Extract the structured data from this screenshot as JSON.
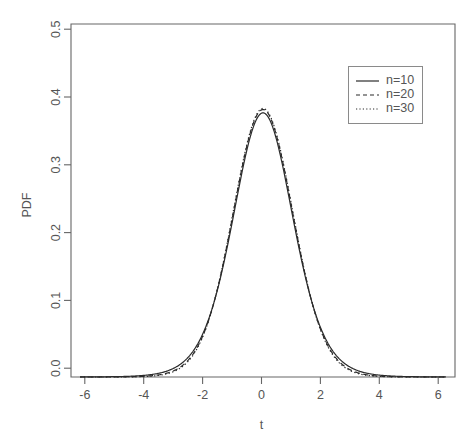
{
  "chart_data": {
    "type": "line",
    "title": "",
    "xlabel": "t",
    "ylabel": "PDF",
    "xlim": [
      -6.3,
      6.3
    ],
    "ylim": [
      0.0,
      0.52
    ],
    "grid": false,
    "legend_position": "top-right",
    "xticks": [
      "-6",
      "-4",
      "-2",
      "0",
      "2",
      "4",
      "6"
    ],
    "xtick_values": [
      -6,
      -4,
      -2,
      0,
      2,
      4,
      6
    ],
    "yticks": [
      "0.0",
      "0.1",
      "0.2",
      "0.3",
      "0.4",
      "0.5"
    ],
    "ytick_values": [
      0.0,
      0.1,
      0.2,
      0.3,
      0.4,
      0.5
    ],
    "x": [
      -6.0,
      -5.75,
      -5.5,
      -5.25,
      -5.0,
      -4.75,
      -4.5,
      -4.25,
      -4.0,
      -3.75,
      -3.5,
      -3.25,
      -3.0,
      -2.75,
      -2.5,
      -2.25,
      -2.0,
      -1.75,
      -1.5,
      -1.25,
      -1.0,
      -0.75,
      -0.5,
      -0.25,
      0.0,
      0.25,
      0.5,
      0.75,
      1.0,
      1.25,
      1.5,
      1.75,
      2.0,
      2.25,
      2.5,
      2.75,
      3.0,
      3.25,
      3.5,
      3.75,
      4.0,
      4.25,
      4.5,
      4.75,
      5.0,
      5.25,
      5.5,
      5.75,
      6.0
    ],
    "series": [
      {
        "name": "n=10",
        "style": "solid",
        "values": [
          0.0007,
          0.0009,
          0.0011,
          0.0014,
          0.0018,
          0.0023,
          0.003,
          0.0039,
          0.0051,
          0.0068,
          0.0091,
          0.0123,
          0.0168,
          0.0231,
          0.0322,
          0.045,
          0.0628,
          0.0868,
          0.1176,
          0.1548,
          0.1968,
          0.2402,
          0.2803,
          0.3123,
          0.3891,
          0.3123,
          0.2803,
          0.2402,
          0.1968,
          0.1548,
          0.1176,
          0.0868,
          0.0628,
          0.045,
          0.0322,
          0.0231,
          0.0168,
          0.0123,
          0.0091,
          0.0068,
          0.0051,
          0.0039,
          0.003,
          0.0023,
          0.0018,
          0.0014,
          0.0011,
          0.0009,
          0.0007
        ]
      },
      {
        "name": "n=20",
        "style": "dashed",
        "values": [
          0.0003,
          0.0004,
          0.0005,
          0.0007,
          0.0009,
          0.0012,
          0.0017,
          0.0023,
          0.0032,
          0.0045,
          0.0064,
          0.0093,
          0.0136,
          0.0201,
          0.0298,
          0.0441,
          0.0645,
          0.0925,
          0.1286,
          0.1718,
          0.2186,
          0.2633,
          0.3004,
          0.3259,
          0.394,
          0.3259,
          0.3004,
          0.2633,
          0.2186,
          0.1718,
          0.1286,
          0.0925,
          0.0645,
          0.0441,
          0.0298,
          0.0201,
          0.0136,
          0.0093,
          0.0064,
          0.0045,
          0.0032,
          0.0023,
          0.0017,
          0.0012,
          0.0009,
          0.0007,
          0.0005,
          0.0004,
          0.0003
        ]
      },
      {
        "name": "n=30",
        "style": "dotted",
        "values": [
          0.0002,
          0.0002,
          0.0003,
          0.0004,
          0.0006,
          0.0008,
          0.0012,
          0.0017,
          0.0025,
          0.0037,
          0.0055,
          0.0082,
          0.0124,
          0.0188,
          0.0286,
          0.0434,
          0.0651,
          0.095,
          0.1336,
          0.179,
          0.2265,
          0.2704,
          0.3058,
          0.3295,
          0.3961,
          0.3295,
          0.3058,
          0.2704,
          0.2265,
          0.179,
          0.1336,
          0.095,
          0.0651,
          0.0434,
          0.0286,
          0.0188,
          0.0124,
          0.0082,
          0.0055,
          0.0037,
          0.0025,
          0.0017,
          0.0012,
          0.0008,
          0.0006,
          0.0004,
          0.0003,
          0.0002,
          0.0002
        ]
      }
    ],
    "peak_values": {
      "n=10": 0.389,
      "n=20": 0.394,
      "n=30": 0.396
    },
    "colors": {
      "line": "#2b2b2b",
      "axis": "#666666",
      "text": "#555555",
      "background": "#ffffff"
    }
  },
  "legend": {
    "entries": [
      {
        "label": "n=10"
      },
      {
        "label": "n=20"
      },
      {
        "label": "n=30"
      }
    ]
  }
}
